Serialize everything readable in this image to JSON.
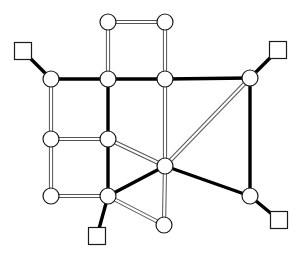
{
  "figure": {
    "width": 301,
    "height": 256,
    "background_color": "#ffffff"
  },
  "style": {
    "circle_fill": "#ffffff",
    "circle_stroke": "#1a1a1a",
    "circle_stroke_width": 1.2,
    "circle_radius": 8,
    "square_fill": "#ffffff",
    "square_stroke": "#1a1a1a",
    "square_stroke_width": 1.2,
    "square_size": 17,
    "thin_edge_color": "#555555",
    "thin_edge_outer_width": 4.2,
    "thin_edge_inner_color": "#ffffff",
    "thin_edge_inner_width": 2.2,
    "thick_edge_color": "#000000",
    "thick_edge_width": 3.4
  },
  "chart_data": {
    "type": "diagram",
    "subtype": "node-link-graph",
    "nodes": [
      {
        "id": "c1",
        "shape": "circle",
        "x": 108,
        "y": 22,
        "label": ""
      },
      {
        "id": "c2",
        "shape": "circle",
        "x": 165,
        "y": 22,
        "label": ""
      },
      {
        "id": "c3",
        "shape": "circle",
        "x": 51,
        "y": 79,
        "label": ""
      },
      {
        "id": "c4",
        "shape": "circle",
        "x": 108,
        "y": 79,
        "label": ""
      },
      {
        "id": "c5",
        "shape": "circle",
        "x": 165,
        "y": 79,
        "label": ""
      },
      {
        "id": "c6",
        "shape": "circle",
        "x": 250,
        "y": 78,
        "label": ""
      },
      {
        "id": "c7",
        "shape": "circle",
        "x": 51,
        "y": 139,
        "label": ""
      },
      {
        "id": "c8",
        "shape": "circle",
        "x": 108,
        "y": 139,
        "label": ""
      },
      {
        "id": "c9",
        "shape": "circle",
        "x": 165,
        "y": 166,
        "label": ""
      },
      {
        "id": "c10",
        "shape": "circle",
        "x": 51,
        "y": 196,
        "label": ""
      },
      {
        "id": "c11",
        "shape": "circle",
        "x": 108,
        "y": 196,
        "label": ""
      },
      {
        "id": "c12",
        "shape": "circle",
        "x": 250,
        "y": 196,
        "label": ""
      },
      {
        "id": "c13",
        "shape": "circle",
        "x": 164,
        "y": 225,
        "label": ""
      },
      {
        "id": "s1",
        "shape": "square",
        "x": 23,
        "y": 51,
        "label": ""
      },
      {
        "id": "s2",
        "shape": "square",
        "x": 278,
        "y": 50,
        "label": ""
      },
      {
        "id": "s3",
        "shape": "square",
        "x": 97,
        "y": 236,
        "label": ""
      },
      {
        "id": "s4",
        "shape": "square",
        "x": 279,
        "y": 220,
        "label": ""
      }
    ],
    "edges": [
      {
        "from": "c1",
        "to": "c2",
        "weight": "thin"
      },
      {
        "from": "c1",
        "to": "c4",
        "weight": "thin"
      },
      {
        "from": "c2",
        "to": "c5",
        "weight": "thin"
      },
      {
        "from": "s1",
        "to": "c3",
        "weight": "thick"
      },
      {
        "from": "c3",
        "to": "c4",
        "weight": "thick"
      },
      {
        "from": "c4",
        "to": "c5",
        "weight": "thick"
      },
      {
        "from": "c5",
        "to": "c6",
        "weight": "thick"
      },
      {
        "from": "s2",
        "to": "c6",
        "weight": "thick"
      },
      {
        "from": "c3",
        "to": "c7",
        "weight": "thin"
      },
      {
        "from": "c4",
        "to": "c8",
        "weight": "thick"
      },
      {
        "from": "c5",
        "to": "c9",
        "weight": "thin"
      },
      {
        "from": "c6",
        "to": "c9",
        "weight": "thin"
      },
      {
        "from": "c6",
        "to": "c12",
        "weight": "thick"
      },
      {
        "from": "c7",
        "to": "c8",
        "weight": "thin"
      },
      {
        "from": "c7",
        "to": "c10",
        "weight": "thin"
      },
      {
        "from": "c8",
        "to": "c9",
        "weight": "thin"
      },
      {
        "from": "c8",
        "to": "c11",
        "weight": "thick"
      },
      {
        "from": "c9",
        "to": "c11",
        "weight": "thick"
      },
      {
        "from": "c9",
        "to": "c12",
        "weight": "thick"
      },
      {
        "from": "c9",
        "to": "c13",
        "weight": "thin"
      },
      {
        "from": "c10",
        "to": "c11",
        "weight": "thin"
      },
      {
        "from": "c11",
        "to": "s3",
        "weight": "thick"
      },
      {
        "from": "c11",
        "to": "c13",
        "weight": "thin"
      },
      {
        "from": "c12",
        "to": "s4",
        "weight": "thick"
      }
    ],
    "legend": [],
    "annotations": []
  }
}
